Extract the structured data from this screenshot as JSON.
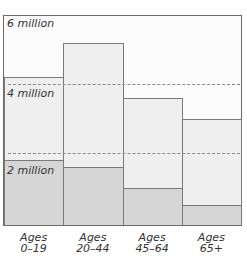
{
  "chart_data": {
    "type": "bar",
    "title": "",
    "xlabel": "",
    "ylabel": "",
    "categories": [
      "Ages 0–19",
      "Ages 20–44",
      "Ages 45–64",
      "Ages 65+"
    ],
    "category_lines": [
      [
        "Ages",
        "0–19"
      ],
      [
        "Ages",
        "20–44"
      ],
      [
        "Ages",
        "45–64"
      ],
      [
        "Ages",
        "65+"
      ]
    ],
    "series": [
      {
        "name": "Total",
        "values": [
          4.2,
          5.2,
          3.6,
          3.0
        ],
        "color": "#efefef"
      },
      {
        "name": "Subset (shaded)",
        "values": [
          1.8,
          1.6,
          1.0,
          0.5
        ],
        "color": "#d6d6d6"
      }
    ],
    "units": "million",
    "ylim": [
      0,
      6
    ],
    "y_tick_labels": [
      "2 million",
      "4 million",
      "6 million"
    ],
    "y_ticks": [
      2,
      4,
      6
    ],
    "grid": "dashed horizontal at 2 and 4 million",
    "legend": "none"
  }
}
